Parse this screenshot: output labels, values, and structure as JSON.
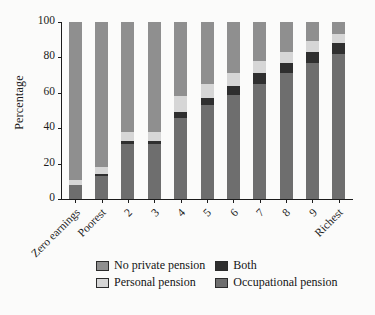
{
  "chart_data": {
    "type": "bar",
    "subtype": "stacked-bar-100",
    "title": "",
    "xlabel": "",
    "ylabel": "Percentage",
    "ylim": [
      0,
      100
    ],
    "yticks": [
      0,
      20,
      40,
      60,
      80,
      100
    ],
    "ytick_labels": [
      "0",
      "20",
      "40",
      "60",
      "80",
      "100"
    ],
    "grid": false,
    "legend_position": "below-axes",
    "categories": [
      "Zero earnings",
      "Poorest",
      "2",
      "3",
      "4",
      "5",
      "6",
      "7",
      "8",
      "9",
      "Richest"
    ],
    "series": [
      {
        "name": "Occupational pension",
        "color": "#6e6e6e",
        "values": [
          8,
          13,
          31,
          31,
          46,
          53,
          59,
          65,
          71,
          77,
          82
        ]
      },
      {
        "name": "Both",
        "color": "#2f2f2f",
        "values": [
          0,
          1,
          2,
          2,
          3,
          4,
          5,
          6,
          6,
          6,
          6
        ]
      },
      {
        "name": "Personal pension",
        "color": "#d6d6d6",
        "values": [
          3,
          4,
          5,
          5,
          9,
          8,
          7,
          7,
          6,
          6,
          5
        ]
      },
      {
        "name": "No private pension",
        "color": "#8f8f8f",
        "values": [
          89,
          82,
          62,
          62,
          42,
          35,
          29,
          22,
          17,
          11,
          7
        ]
      }
    ],
    "stack_order_bottom_to_top": [
      "Occupational pension",
      "Both",
      "Personal pension",
      "No private pension"
    ]
  },
  "legend": {
    "entries": [
      {
        "label": "No private pension",
        "color": "#8f8f8f",
        "swatch": "legend-swatch-no-private-pension"
      },
      {
        "label": "Both",
        "color": "#2f2f2f",
        "swatch": "legend-swatch-both"
      },
      {
        "label": "Personal pension",
        "color": "#d6d6d6",
        "swatch": "legend-swatch-personal-pension"
      },
      {
        "label": "Occupational pension",
        "color": "#6e6e6e",
        "swatch": "legend-swatch-occupational-pension"
      }
    ]
  },
  "colors": {
    "no_private_pension": "#8f8f8f",
    "both": "#2f2f2f",
    "personal_pension": "#d6d6d6",
    "occupational_pension": "#6e6e6e",
    "axis": "#1c1c1c",
    "background": "#fbfbfa"
  }
}
